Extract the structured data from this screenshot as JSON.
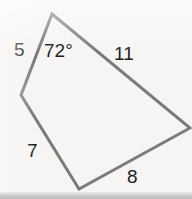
{
  "figure": {
    "kind": "polygon-diagram",
    "shape_name": "irregular-quadrilateral",
    "stroke_color": "#7b7b7b",
    "background_color": "#f6f5f3",
    "text_color": "#1d1d1d",
    "stroke_width": 3,
    "canvas": {
      "width": 192,
      "height": 199
    },
    "vertices": [
      {
        "name": "apex-top",
        "x": 52,
        "y": 14
      },
      {
        "name": "left",
        "x": 21,
        "y": 95
      },
      {
        "name": "bottom",
        "x": 79,
        "y": 189
      },
      {
        "name": "right",
        "x": 190,
        "y": 128
      }
    ],
    "sides": [
      {
        "id": "side-5",
        "label": "5",
        "from": "apex-top",
        "to": "left"
      },
      {
        "id": "side-7",
        "label": "7",
        "from": "left",
        "to": "bottom"
      },
      {
        "id": "side-8",
        "label": "8",
        "from": "bottom",
        "to": "right"
      },
      {
        "id": "side-11",
        "label": "11",
        "from": "right",
        "to": "apex-top"
      }
    ],
    "angles": [
      {
        "id": "angle-apex",
        "label": "72°",
        "at_vertex": "apex-top",
        "value": 72,
        "unit": "degrees"
      }
    ],
    "labels": {
      "side_5": "5",
      "side_11": "11",
      "side_7": "7",
      "side_8": "8",
      "angle_apex": "72°"
    }
  }
}
